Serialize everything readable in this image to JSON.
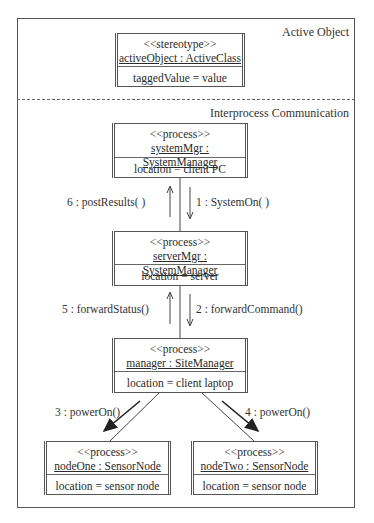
{
  "regions": {
    "active_object": "Active Object",
    "interprocess": "Interprocess Communication"
  },
  "objects": {
    "active": {
      "stereotype": "<<stereotype>>",
      "name": "activeObject : ActiveClass",
      "attribute": "taggedValue = value"
    },
    "systemMgr": {
      "stereotype": "<<process>>",
      "name": "systemMgr : SystemManager",
      "attribute": "location = client PC"
    },
    "serverMgr": {
      "stereotype": "<<process>>",
      "name": "serverMgr : SystemManager",
      "attribute": "location = server"
    },
    "manager": {
      "stereotype": "<<process>>",
      "name": "manager : SiteManager",
      "attribute": "location = client laptop"
    },
    "nodeOne": {
      "stereotype": "<<process>>",
      "name": "nodeOne : SensorNode",
      "attribute": "location = sensor node"
    },
    "nodeTwo": {
      "stereotype": "<<process>>",
      "name": "nodeTwo : SensorNode",
      "attribute": "location = sensor node"
    }
  },
  "messages": {
    "m1": "1 : SystemOn( )",
    "m2": "2 : forwardCommand()",
    "m3": "3 : powerOn()",
    "m4": "4 : powerOn()",
    "m5": "5 : forwardStatus()",
    "m6": "6 : postResults( )"
  }
}
